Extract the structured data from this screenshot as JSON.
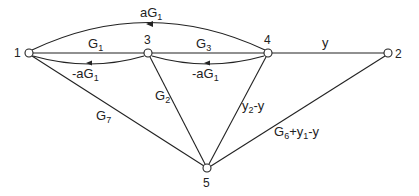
{
  "diagram": {
    "type": "signal-flow-graph",
    "nodes": [
      {
        "id": "1",
        "label": "1",
        "x": 29,
        "y": 53
      },
      {
        "id": "3",
        "label": "3",
        "x": 148,
        "y": 53
      },
      {
        "id": "4",
        "label": "4",
        "x": 268,
        "y": 53
      },
      {
        "id": "2",
        "label": "2",
        "x": 388,
        "y": 53
      },
      {
        "id": "5",
        "label": "5",
        "x": 207,
        "y": 168
      }
    ],
    "edges": [
      {
        "from": "4",
        "to": "1",
        "label_main": "aG",
        "label_sub": "1",
        "shape": "arc-top"
      },
      {
        "from": "1",
        "to": "3",
        "label_main": "G",
        "label_sub": "1",
        "shape": "straight"
      },
      {
        "from": "3",
        "to": "1",
        "label_main": "-aG",
        "label_sub": "1",
        "shape": "arc-below"
      },
      {
        "from": "3",
        "to": "4",
        "label_main": "G",
        "label_sub": "3",
        "shape": "straight"
      },
      {
        "from": "4",
        "to": "3",
        "label_main": "-aG",
        "label_sub": "1",
        "shape": "arc-below"
      },
      {
        "from": "4",
        "to": "2",
        "label_main": "y",
        "label_sub": "",
        "shape": "straight"
      },
      {
        "from": "1",
        "to": "5",
        "label_main": "G",
        "label_sub": "7",
        "shape": "straight"
      },
      {
        "from": "3",
        "to": "5",
        "label_main": "G",
        "label_sub": "2",
        "shape": "straight"
      },
      {
        "from": "4",
        "to": "5",
        "label_main": "y",
        "label_sub": "2",
        "label_tail": "-y",
        "shape": "straight"
      },
      {
        "from": "2",
        "to": "5",
        "label_main": "G",
        "label_sub": "6",
        "label_tail": "+y",
        "label_sub2": "1",
        "label_tail2": "-y",
        "shape": "straight"
      }
    ]
  }
}
